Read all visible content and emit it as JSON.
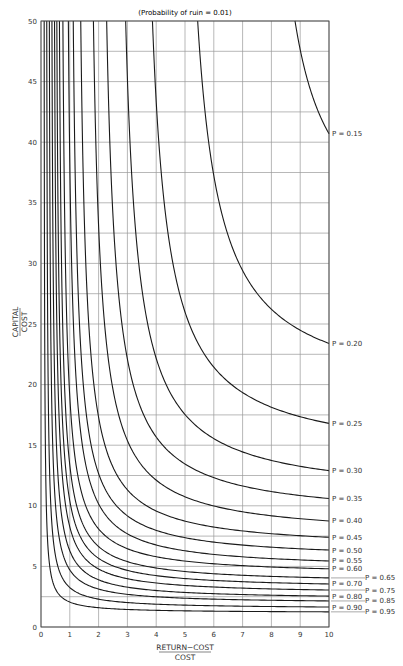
{
  "chart_data": {
    "type": "line",
    "title": "(Probability of ruin = 0.01)",
    "xlabel_numerator": "RETURN−COST",
    "xlabel_denominator": "COST",
    "ylabel_numerator": "CAPITAL",
    "ylabel_denominator": "COST",
    "xlim": [
      0,
      10
    ],
    "ylim": [
      0,
      50
    ],
    "x_ticks": [
      0,
      1,
      2,
      3,
      4,
      5,
      6,
      7,
      8,
      9,
      10
    ],
    "y_ticks": [
      0,
      5,
      10,
      15,
      20,
      25,
      30,
      35,
      40,
      45,
      50
    ],
    "y_tick_labels": [
      "0",
      "5",
      "10",
      "15",
      "20",
      "25",
      "30",
      "35",
      "40",
      "45",
      "50"
    ],
    "x_tick_labels": [
      "0",
      "1",
      "2",
      "3",
      "4",
      "5",
      "6",
      "7",
      "8",
      "9",
      "10"
    ],
    "grid": true,
    "grid_x_step": 1,
    "grid_y_step": 2.5,
    "legend_position": "right-edge inline labels",
    "series": [
      {
        "name": "P = 0.15",
        "x_at_top": 8.82,
        "y_at_x10": 40.7,
        "label_side": "left"
      },
      {
        "name": "P = 0.20",
        "x_at_top": 5.44,
        "y_at_x10": 23.4,
        "label_side": "left"
      },
      {
        "name": "P = 0.25",
        "x_at_top": 3.87,
        "y_at_x10": 16.8,
        "label_side": "left"
      },
      {
        "name": "P = 0.30",
        "x_at_top": 2.94,
        "y_at_x10": 12.9,
        "label_side": "left"
      },
      {
        "name": "P = 0.35",
        "x_at_top": 2.28,
        "y_at_x10": 10.6,
        "label_side": "left"
      },
      {
        "name": "P = 0.40",
        "x_at_top": 1.82,
        "y_at_x10": 8.75,
        "label_side": "left"
      },
      {
        "name": "P = 0.45",
        "x_at_top": 1.38,
        "y_at_x10": 7.4,
        "label_side": "left"
      },
      {
        "name": "P = 0.50",
        "x_at_top": 1.12,
        "y_at_x10": 6.35,
        "label_side": "left"
      },
      {
        "name": "P = 0.55",
        "x_at_top": 0.95,
        "y_at_x10": 5.45,
        "label_side": "left"
      },
      {
        "name": "P = 0.60",
        "x_at_top": 0.76,
        "y_at_x10": 4.8,
        "label_side": "left"
      },
      {
        "name": "P = 0.65",
        "x_at_top": 0.64,
        "y_at_x10": 4.05,
        "label_side": "right"
      },
      {
        "name": "P = 0.70",
        "x_at_top": 0.55,
        "y_at_x10": 3.55,
        "label_side": "left"
      },
      {
        "name": "P = 0.75",
        "x_at_top": 0.47,
        "y_at_x10": 3.05,
        "label_side": "right"
      },
      {
        "name": "P = 0.80",
        "x_at_top": 0.38,
        "y_at_x10": 2.55,
        "label_side": "left"
      },
      {
        "name": "P = 0.85",
        "x_at_top": 0.29,
        "y_at_x10": 2.15,
        "label_side": "right"
      },
      {
        "name": "P = 0.90",
        "x_at_top": 0.2,
        "y_at_x10": 1.65,
        "label_side": "left"
      },
      {
        "name": "P = 0.95",
        "x_at_top": 0.11,
        "y_at_x10": 1.25,
        "label_side": "right"
      }
    ]
  },
  "colors": {
    "curve": "#1a1a1a",
    "grid": "#9a9a9a",
    "axis": "#444444",
    "text": "#333333",
    "background": "#ffffff"
  }
}
